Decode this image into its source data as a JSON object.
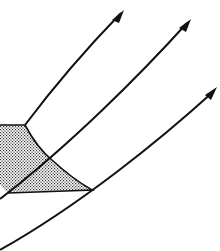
{
  "diagram": {
    "colors": {
      "stroke": "#111111",
      "stipple": "#333333",
      "background": "#ffffff"
    },
    "curves": [
      {
        "id": "curve-a",
        "path": "M 25 125 C 55 85, 90 45, 121 13"
      },
      {
        "id": "curve-b",
        "path": "M 0 199 C 70 145, 140 75, 187 23"
      },
      {
        "id": "curve-c",
        "path": "M 0 250 C 80 205, 160 140, 214 91"
      }
    ],
    "arrowheads": [
      {
        "id": "arrow-a",
        "points": "124,10 112,20 119,23"
      },
      {
        "id": "arrow-b",
        "points": "191,19 179,28 186,32"
      },
      {
        "id": "arrow-c",
        "points": "217,87 205,95 211,100"
      }
    ],
    "region": {
      "path": "M 0 125 L 25 125 C 33 140, 42 152, 52 160 C 65 172, 78 182, 92 190 C 60 190, 30 192, 8 193 C 4 190, 1 186, 0 184 Z",
      "boundary_path": "M 0 125 L 25 125 C 33 140, 42 152, 52 160 C 65 172, 78 182, 92 190 L 8 193"
    }
  }
}
